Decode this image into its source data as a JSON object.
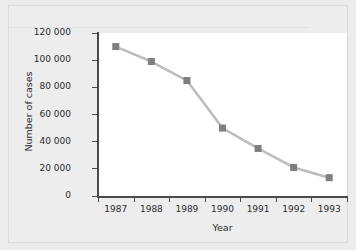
{
  "chart_data": {
    "type": "line",
    "title": "",
    "subtitle": "",
    "xlabel": "Year",
    "ylabel": "Number of cases",
    "categories": [
      "1987",
      "1988",
      "1989",
      "1990",
      "1991",
      "1992",
      "1993"
    ],
    "values": [
      110000,
      99000,
      85000,
      50000,
      35000,
      21000,
      13500
    ],
    "series": [
      {
        "name": "Number of cases",
        "values": [
          110000,
          99000,
          85000,
          50000,
          35000,
          21000,
          13500
        ]
      }
    ],
    "ylim": [
      0,
      120000
    ],
    "ytick_labels": [
      "120 000",
      "100 000",
      "80 000",
      "60 000",
      "40 000",
      "20 000",
      "0"
    ],
    "ytick_values": [
      120000,
      100000,
      80000,
      60000,
      40000,
      20000,
      0
    ],
    "xtick_labels": [
      "1987",
      "1988",
      "1989",
      "1990",
      "1991",
      "1992",
      "1993"
    ],
    "grid": false,
    "legend": "none",
    "marker": "square",
    "line_color": "#bdbdbd",
    "marker_color": "#7f7f7f",
    "axis_color": "#4a4a4a",
    "plot_background": "#ffffff",
    "figure_background": "#ededee"
  },
  "axes": {
    "x_title": "Year",
    "y_title": "Number of cases"
  }
}
